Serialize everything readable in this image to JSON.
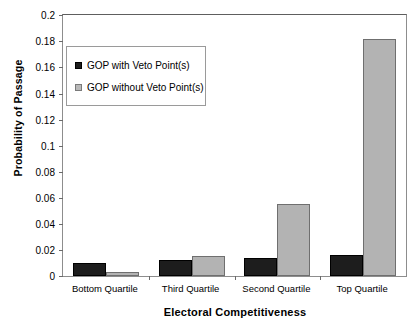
{
  "chart_data": {
    "type": "bar",
    "title": "",
    "xlabel": "Electoral Competitiveness",
    "ylabel": "Probability of Passage",
    "categories": [
      "Bottom Quartile",
      "Third Quartile",
      "Second Quartile",
      "Top Quartile"
    ],
    "series": [
      {
        "name": "GOP with Veto Point(s)",
        "color": "#1d1d1d",
        "values": [
          0.01,
          0.012,
          0.014,
          0.016
        ]
      },
      {
        "name": "GOP without Veto Point(s)",
        "color": "#b3b3b3",
        "values": [
          0.003,
          0.015,
          0.055,
          0.182
        ]
      }
    ],
    "ylim": [
      0,
      0.2
    ],
    "ytick_values": [
      0,
      0.02,
      0.04,
      0.06,
      0.08,
      0.1,
      0.12,
      0.14,
      0.16,
      0.18,
      0.2
    ],
    "ytick_labels": [
      "0",
      "0.02",
      "0.04",
      "0.06",
      "0.08",
      "0.1",
      "0.12",
      "0.14",
      "0.16",
      "0.18",
      "0.2"
    ],
    "grid": false,
    "legend_position": "upper-left-inside"
  }
}
